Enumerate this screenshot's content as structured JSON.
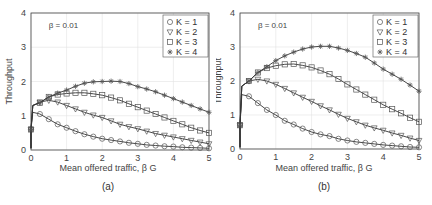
{
  "chart_data": [
    {
      "type": "line",
      "panel_label": "(a)",
      "annotation": "β = 0.01",
      "xlabel": "Mean offered traffic, β G",
      "ylabel": "Throughput",
      "xlim": [
        0,
        5
      ],
      "ylim": [
        0,
        4
      ],
      "xticks": [
        0,
        1,
        2,
        3,
        4,
        5
      ],
      "yticks": [
        0,
        1,
        2,
        3,
        4
      ],
      "grid": true,
      "legend_position": "upper right",
      "x": [
        0,
        0.05,
        0.25,
        0.5,
        0.75,
        1,
        1.25,
        1.5,
        1.75,
        2,
        2.25,
        2.5,
        2.75,
        3,
        3.25,
        3.5,
        3.75,
        4,
        4.25,
        4.5,
        4.75,
        5
      ],
      "series": [
        {
          "name": "K = 1",
          "marker": "circle",
          "values": [
            0.6,
            1.1,
            1.05,
            0.9,
            0.75,
            0.65,
            0.55,
            0.46,
            0.39,
            0.33,
            0.29,
            0.25,
            0.21,
            0.18,
            0.15,
            0.13,
            0.11,
            0.1,
            0.08,
            0.07,
            0.06,
            0.05
          ]
        },
        {
          "name": "K = 2",
          "marker": "triangle-down",
          "values": [
            0.6,
            1.3,
            1.4,
            1.45,
            1.4,
            1.3,
            1.2,
            1.1,
            1.02,
            0.95,
            0.85,
            0.75,
            0.68,
            0.62,
            0.55,
            0.48,
            0.43,
            0.38,
            0.33,
            0.28,
            0.23,
            0.18
          ]
        },
        {
          "name": "K = 3",
          "marker": "square",
          "values": [
            0.6,
            1.3,
            1.38,
            1.55,
            1.62,
            1.65,
            1.67,
            1.67,
            1.64,
            1.6,
            1.53,
            1.45,
            1.35,
            1.25,
            1.15,
            1.05,
            0.95,
            0.85,
            0.75,
            0.65,
            0.57,
            0.5
          ]
        },
        {
          "name": "K = 4",
          "marker": "asterisk",
          "values": [
            0.6,
            1.3,
            1.38,
            1.55,
            1.66,
            1.75,
            1.86,
            1.95,
            1.99,
            2.0,
            2.01,
            2.0,
            1.94,
            1.85,
            1.78,
            1.7,
            1.6,
            1.5,
            1.4,
            1.3,
            1.2,
            1.1
          ]
        }
      ]
    },
    {
      "type": "line",
      "panel_label": "(b)",
      "annotation": "β = 0.01",
      "xlabel": "Mean offered traffic, β G",
      "ylabel": "Throughput",
      "xlim": [
        0,
        5
      ],
      "ylim": [
        0,
        4
      ],
      "xticks": [
        0,
        1,
        2,
        3,
        4,
        5
      ],
      "yticks": [
        0,
        1,
        2,
        3,
        4
      ],
      "grid": true,
      "legend_position": "upper right",
      "x": [
        0,
        0.05,
        0.25,
        0.5,
        0.75,
        1,
        1.25,
        1.5,
        1.75,
        2,
        2.25,
        2.5,
        2.75,
        3,
        3.25,
        3.5,
        3.75,
        4,
        4.25,
        4.5,
        4.75,
        5
      ],
      "series": [
        {
          "name": "K = 1",
          "marker": "circle",
          "values": [
            0.7,
            1.6,
            1.55,
            1.35,
            1.15,
            1.0,
            0.83,
            0.72,
            0.6,
            0.5,
            0.43,
            0.38,
            0.3,
            0.25,
            0.21,
            0.18,
            0.15,
            0.12,
            0.1,
            0.08,
            0.06,
            0.05
          ]
        },
        {
          "name": "K = 2",
          "marker": "triangle-down",
          "values": [
            0.7,
            1.85,
            2.0,
            2.05,
            2.0,
            1.9,
            1.78,
            1.65,
            1.52,
            1.4,
            1.27,
            1.15,
            1.02,
            0.9,
            0.8,
            0.7,
            0.62,
            0.55,
            0.47,
            0.4,
            0.32,
            0.25
          ]
        },
        {
          "name": "K = 3",
          "marker": "square",
          "values": [
            0.7,
            1.85,
            2.0,
            2.25,
            2.38,
            2.45,
            2.49,
            2.5,
            2.46,
            2.4,
            2.31,
            2.2,
            2.06,
            1.9,
            1.75,
            1.6,
            1.45,
            1.3,
            1.17,
            1.05,
            0.92,
            0.8
          ]
        },
        {
          "name": "K = 4",
          "marker": "asterisk",
          "values": [
            0.7,
            1.85,
            2.0,
            2.25,
            2.42,
            2.6,
            2.74,
            2.85,
            2.94,
            3.0,
            3.02,
            3.02,
            2.97,
            2.9,
            2.81,
            2.7,
            2.53,
            2.35,
            2.2,
            2.05,
            1.88,
            1.7
          ]
        }
      ]
    }
  ]
}
